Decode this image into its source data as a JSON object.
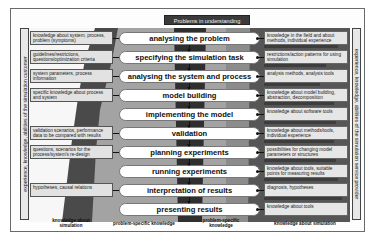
{
  "title": "Problems in understanding",
  "left_vertical_label": "experience, knowledge, abilities of the simulation customer",
  "right_vertical_label": "experience, knowledge, abilities of the simulation service provider",
  "steps": [
    {
      "label": "analysing the problem"
    },
    {
      "label": "specifying the simulation task"
    },
    {
      "label": "analysing the system and process"
    },
    {
      "label": "model building"
    },
    {
      "label": "implementing the model"
    },
    {
      "label": "validation"
    },
    {
      "label": "planning experiments"
    },
    {
      "label": "running experiments"
    },
    {
      "label": "interpretation of results"
    },
    {
      "label": "presenting results"
    }
  ],
  "customer_inputs": [
    {
      "step": 0,
      "text": "knowledge about system, process, problem (symptoms)"
    },
    {
      "step": 1,
      "text": "guidelines/restrictions, questions/optimization criteria"
    },
    {
      "step": 2,
      "text": "system parameters, process information"
    },
    {
      "step": 3,
      "text": "specific knowledge about process and system"
    },
    {
      "step": 5,
      "text": "validation scenarios, performance data to be compared with results"
    },
    {
      "step": 6,
      "text": "questions, scenarios for the process/system's re-design"
    },
    {
      "step": 8,
      "text": "hypotheses, causal relations"
    }
  ],
  "provider_inputs": [
    {
      "step": 0,
      "text": "knowledge in the field and about methods, individual experience"
    },
    {
      "step": 1,
      "text": "restrictions/action patterns for using simulation"
    },
    {
      "step": 2,
      "text": "analysis methods, analysis tools"
    },
    {
      "step": 3,
      "text": "knowledge about model building, abstraction, decomposition"
    },
    {
      "step": 4,
      "text": "knowledge about software tools"
    },
    {
      "step": 5,
      "text": "knowledge about methods/tools, individual experience"
    },
    {
      "step": 6,
      "text": "possibilities for changing model parameters or structures"
    },
    {
      "step": 7,
      "text": "knowledge about tools, suitable points for measuring results"
    },
    {
      "step": 8,
      "text": "diagnosis, hypotheses"
    },
    {
      "step": 9,
      "text": "knowledge about tools"
    }
  ],
  "footer_labels": {
    "customer_sim_knowledge": "knowledge about simulation",
    "customer_problem_knowledge": "problem-specific knowledge",
    "provider_problem_knowledge": "problem-specific knowledge",
    "provider_sim_knowledge": "knowledge about simulation"
  },
  "colors": {
    "dark_band": "#3d3d3d",
    "mid_band": "#9a9a9a",
    "light_band": "#f4f4f4",
    "box_fill": "#e2e2e2"
  }
}
